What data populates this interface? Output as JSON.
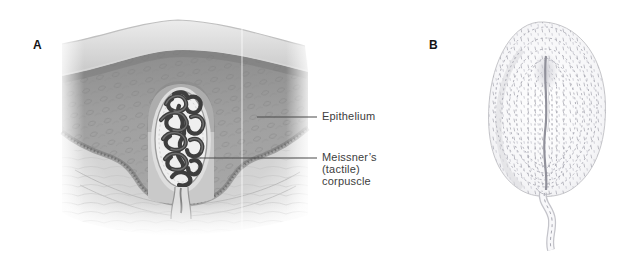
{
  "figure": {
    "panels": [
      {
        "letter": "A"
      },
      {
        "letter": "B"
      }
    ],
    "labels": {
      "epithelium": "Epithelium",
      "meissner": "Meissner’s\n(tactile)\ncorpuscle"
    },
    "colors": {
      "label_text": "#3d3d3d",
      "leader_line": "#4a4a4a",
      "panel_letter": "#141414",
      "stratum_corneum": "#d6d6d6",
      "epidermis": "#9a9a9a",
      "basal_border": "#6e6e6e",
      "papilla": "#c9c9c9",
      "capsule_fill": "#efefef",
      "nerve_coil": "#3e3e3e",
      "corpuscle_b_stipple": "#a6a6b0",
      "background": "#ffffff"
    }
  }
}
